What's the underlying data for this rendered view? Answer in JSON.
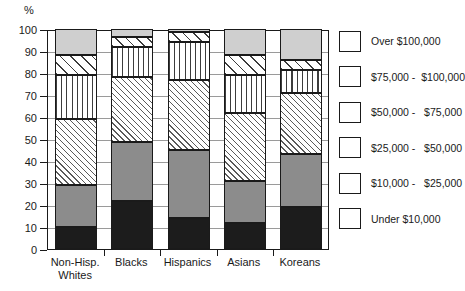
{
  "chart_data": {
    "type": "bar",
    "stacked": true,
    "title": "",
    "xlabel": "",
    "ylabel": "%",
    "ylim": [
      0,
      100
    ],
    "yticks": [
      0,
      10,
      20,
      30,
      40,
      50,
      60,
      70,
      80,
      90,
      100
    ],
    "grid": true,
    "legend_position": "right",
    "categories": [
      "Non-Hisp.\nWhites",
      "Blacks",
      "Hispanics",
      "Asians",
      "Koreans"
    ],
    "category_lines": [
      [
        "Non-Hisp.",
        "Whites"
      ],
      [
        "Blacks"
      ],
      [
        "Hispanics"
      ],
      [
        "Asians"
      ],
      [
        "Koreans"
      ]
    ],
    "series": [
      {
        "name": "Under $10,000",
        "values": [
          10.0,
          22.0,
          14.0,
          12.0,
          19.0
        ]
      },
      {
        "name": "$10,000 -  $25,000",
        "values": [
          19.0,
          26.5,
          31.0,
          19.0,
          24.0
        ]
      },
      {
        "name": "$25,000 -  $50,000",
        "values": [
          30.0,
          29.5,
          32.0,
          31.0,
          28.0
        ]
      },
      {
        "name": "$50,000 -  $75,000",
        "values": [
          20.0,
          14.0,
          17.0,
          17.0,
          10.5
        ]
      },
      {
        "name": "$75,000 -  $100,000",
        "values": [
          9.0,
          4.5,
          4.5,
          9.0,
          4.5
        ]
      },
      {
        "name": "Over $100,000",
        "values": [
          12.0,
          3.5,
          1.5,
          12.0,
          14.0
        ]
      }
    ],
    "cumulative_tops": {
      "Non-Hisp. Whites": [
        10.0,
        29.0,
        59.0,
        79.0,
        88.0,
        100.0
      ],
      "Blacks": [
        22.0,
        48.5,
        78.0,
        92.0,
        96.5,
        100.0
      ],
      "Hispanics": [
        14.0,
        45.0,
        77.0,
        94.0,
        98.5,
        100.0
      ],
      "Asians": [
        12.0,
        31.0,
        62.0,
        79.0,
        88.0,
        100.0
      ],
      "Koreans": [
        19.0,
        43.0,
        71.0,
        81.5,
        86.0,
        100.0
      ]
    }
  },
  "axis": {
    "unit_label": "%",
    "ytick_labels": [
      "100",
      "90",
      "80",
      "70",
      "60",
      "50",
      "40",
      "30",
      "20",
      "10",
      "0"
    ]
  },
  "legend": {
    "items": [
      {
        "label": "Over $100,000",
        "pattern": "p-solid-light",
        "swatch_name": "legend-swatch-over-100k"
      },
      {
        "label": "$75,000 -  $100,000",
        "pattern": "p-diag-wide",
        "swatch_name": "legend-swatch-75k-100k"
      },
      {
        "label": "$50,000 -   $75,000",
        "pattern": "p-vert",
        "swatch_name": "legend-swatch-50k-75k"
      },
      {
        "label": "$25,000 -   $50,000",
        "pattern": "p-diag-fine",
        "swatch_name": "legend-swatch-25k-50k"
      },
      {
        "label": "$10,000 -   $25,000",
        "pattern": "p-solid-mid",
        "swatch_name": "legend-swatch-10k-25k"
      },
      {
        "label": "Under $10,000",
        "pattern": "p-solid-dark",
        "swatch_name": "legend-swatch-under-10k"
      }
    ]
  },
  "colors": {
    "axis": "#1a1a1a",
    "grid": "#9a9a9a",
    "solid_dark": "#1c1c1c",
    "solid_mid": "#8c8c8c",
    "solid_light": "#cfcfcf",
    "background": "#ffffff"
  }
}
